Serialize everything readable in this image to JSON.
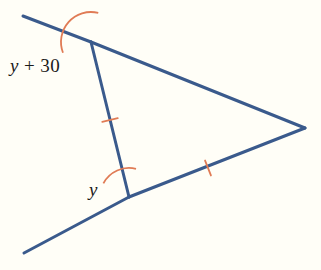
{
  "figure": {
    "background_color": "#fffef7",
    "line_color": "#3a5a8c",
    "mark_color": "#e07b55",
    "text_color": "#1a1a1a",
    "line_width": 3,
    "mark_width": 1.8
  },
  "labels": {
    "upper_angle": {
      "variable": "y",
      "operator": "+",
      "constant": "30",
      "full_text": "y + 30",
      "x": 10,
      "y": 56
    },
    "lower_angle": {
      "variable": "y",
      "full_text": "y",
      "x": 89,
      "y": 180
    }
  },
  "points": {
    "upper_vertex": {
      "name": "A",
      "x": 91,
      "y": 42
    },
    "lower_vertex": {
      "name": "B",
      "x": 129,
      "y": 197
    },
    "apex": {
      "name": "C",
      "x": 305,
      "y": 128
    },
    "upper_ray_end": {
      "name": "D",
      "x": 23,
      "y": 16
    },
    "lower_ray_end": {
      "name": "E",
      "x": 24,
      "y": 253
    }
  },
  "segments": [
    {
      "name": "upper-ray-extension",
      "from": "D",
      "to": "A",
      "x1": 23,
      "y1": 16,
      "x2": 91,
      "y2": 42
    },
    {
      "name": "upper-side",
      "from": "A",
      "to": "C",
      "x1": 91,
      "y1": 42,
      "x2": 305,
      "y2": 128
    },
    {
      "name": "lower-side",
      "from": "C",
      "to": "B",
      "x1": 305,
      "y1": 128,
      "x2": 129,
      "y2": 197
    },
    {
      "name": "lower-ray-extension",
      "from": "B",
      "to": "E",
      "x1": 129,
      "y1": 197,
      "x2": 24,
      "y2": 253
    },
    {
      "name": "transversal",
      "from": "A",
      "to": "B",
      "x1": 91,
      "y1": 42,
      "x2": 129,
      "y2": 197
    }
  ],
  "tick_marks": [
    {
      "name": "tick-on-transversal",
      "segment": "transversal",
      "x": 110,
      "y": 120,
      "count": 1
    },
    {
      "name": "tick-on-lower-side",
      "segment": "lower-side",
      "x": 208,
      "y": 168,
      "count": 1
    }
  ],
  "angle_arcs": [
    {
      "name": "upper-angle-arc",
      "vertex": "A",
      "radius": 30,
      "start_angle_deg": 159,
      "end_angle_deg": 284,
      "label": "y + 30"
    },
    {
      "name": "lower-angle-arc",
      "vertex": "B",
      "radius": 29,
      "start_angle_deg": 208,
      "end_angle_deg": 284,
      "label": "y"
    }
  ]
}
